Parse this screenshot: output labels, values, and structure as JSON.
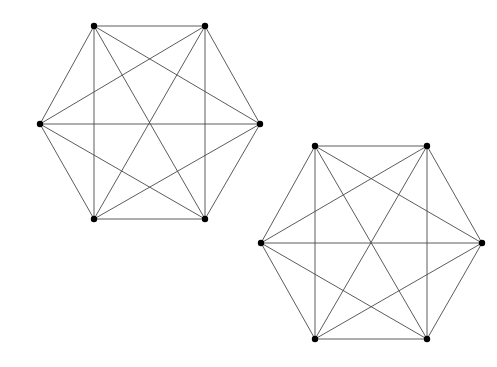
{
  "diagram": {
    "style": {
      "background": "#ffffff",
      "edge_color": "#4a4a4a",
      "vertex_color": "#000000",
      "vertex_radius": 3.2
    },
    "graphs": [
      {
        "name": "graph-1",
        "type": "complete-graph-K6",
        "vertices": [
          {
            "id": "top-left",
            "x": 94,
            "y": 26
          },
          {
            "id": "top-right",
            "x": 205,
            "y": 26
          },
          {
            "id": "left",
            "x": 40,
            "y": 124
          },
          {
            "id": "right",
            "x": 260,
            "y": 124
          },
          {
            "id": "bottom-left",
            "x": 94,
            "y": 219
          },
          {
            "id": "bottom-right",
            "x": 205,
            "y": 219
          }
        ],
        "edges": [
          [
            "top-left",
            "top-right"
          ],
          [
            "top-left",
            "left"
          ],
          [
            "top-left",
            "right"
          ],
          [
            "top-left",
            "bottom-left"
          ],
          [
            "top-left",
            "bottom-right"
          ],
          [
            "top-right",
            "left"
          ],
          [
            "top-right",
            "right"
          ],
          [
            "top-right",
            "bottom-left"
          ],
          [
            "top-right",
            "bottom-right"
          ],
          [
            "left",
            "right"
          ],
          [
            "left",
            "bottom-left"
          ],
          [
            "left",
            "bottom-right"
          ],
          [
            "right",
            "bottom-left"
          ],
          [
            "right",
            "bottom-right"
          ],
          [
            "bottom-left",
            "bottom-right"
          ]
        ]
      },
      {
        "name": "graph-2",
        "type": "complete-graph-K6",
        "vertices": [
          {
            "id": "top-left",
            "x": 315,
            "y": 146
          },
          {
            "id": "top-right",
            "x": 427,
            "y": 146
          },
          {
            "id": "left",
            "x": 261,
            "y": 243
          },
          {
            "id": "right",
            "x": 482,
            "y": 243
          },
          {
            "id": "bottom-left",
            "x": 315,
            "y": 339
          },
          {
            "id": "bottom-right",
            "x": 427,
            "y": 339
          }
        ],
        "edges": [
          [
            "top-left",
            "top-right"
          ],
          [
            "top-left",
            "left"
          ],
          [
            "top-left",
            "right"
          ],
          [
            "top-left",
            "bottom-left"
          ],
          [
            "top-left",
            "bottom-right"
          ],
          [
            "top-right",
            "left"
          ],
          [
            "top-right",
            "right"
          ],
          [
            "top-right",
            "bottom-left"
          ],
          [
            "top-right",
            "bottom-right"
          ],
          [
            "left",
            "right"
          ],
          [
            "left",
            "bottom-left"
          ],
          [
            "left",
            "bottom-right"
          ],
          [
            "right",
            "bottom-left"
          ],
          [
            "right",
            "bottom-right"
          ],
          [
            "bottom-left",
            "bottom-right"
          ]
        ]
      }
    ]
  }
}
